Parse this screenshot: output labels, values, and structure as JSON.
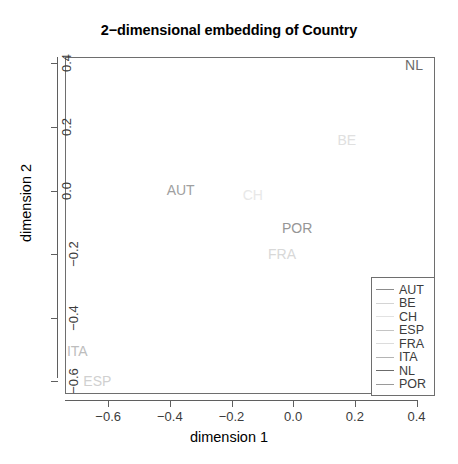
{
  "chart_data": {
    "type": "scatter",
    "title": "2−dimensional embedding of Country",
    "xlabel": "dimension 1",
    "ylabel": "dimension 2",
    "xlim": [
      -0.74,
      0.46
    ],
    "ylim": [
      -0.64,
      0.42
    ],
    "xticks": [
      "−0.6",
      "−0.4",
      "−0.2",
      "0.0",
      "0.2",
      "0.4"
    ],
    "xtickvalues": [
      -0.6,
      -0.4,
      -0.2,
      0.0,
      0.2,
      0.4
    ],
    "yticks": [
      "0.4",
      "0.2",
      "0.0",
      "−0.2",
      "−0.4",
      "−0.6"
    ],
    "ytickvalues": [
      0.4,
      0.2,
      0.0,
      -0.2,
      -0.4,
      -0.6
    ],
    "grid": false,
    "marker_style": "text-label",
    "legend_position": "bottom-right",
    "points": [
      {
        "label": "NL",
        "x": 0.392,
        "y": 0.395,
        "color": "#6b6b6b"
      },
      {
        "label": "BE",
        "x": 0.174,
        "y": 0.16,
        "color": "#e0e0e0"
      },
      {
        "label": "AUT",
        "x": -0.365,
        "y": 0.003,
        "color": "#a0a0a0"
      },
      {
        "label": "CH",
        "x": -0.131,
        "y": -0.013,
        "color": "#e8e8e8"
      },
      {
        "label": "POR",
        "x": 0.013,
        "y": -0.117,
        "color": "#969696"
      },
      {
        "label": "FRA",
        "x": -0.036,
        "y": -0.2,
        "color": "#d8d8d8"
      },
      {
        "label": "ITA",
        "x": -0.7,
        "y": -0.505,
        "color": "#bdbdbd"
      },
      {
        "label": "ESP",
        "x": -0.635,
        "y": -0.6,
        "color": "#d0d0d0"
      }
    ],
    "legend": [
      {
        "label": "AUT",
        "color": "#8c8c8c"
      },
      {
        "label": "BE",
        "color": "#d4d4d4"
      },
      {
        "label": "CH",
        "color": "#e2e2e2"
      },
      {
        "label": "ESP",
        "color": "#c4c4c4"
      },
      {
        "label": "FRA",
        "color": "#dcdcdc"
      },
      {
        "label": "ITA",
        "color": "#b4b4b4"
      },
      {
        "label": "NL",
        "color": "#6b6b6b"
      },
      {
        "label": "POR",
        "color": "#9a9a9a"
      }
    ]
  }
}
